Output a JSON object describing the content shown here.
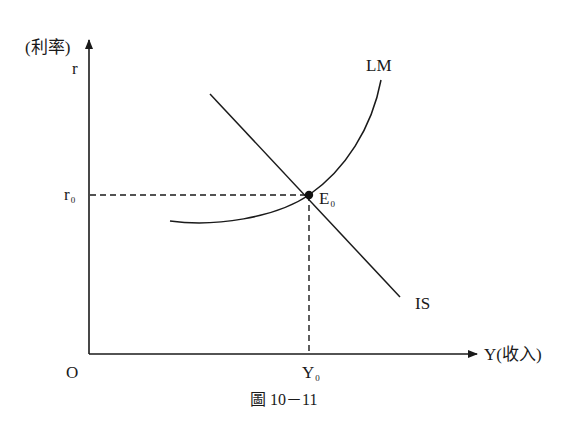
{
  "diagram": {
    "type": "IS-LM model",
    "y_axis": {
      "label": "(利率)",
      "symbol": "r"
    },
    "x_axis": {
      "label": "Y(收入)"
    },
    "origin_label": "O",
    "equilibrium": {
      "label": "E",
      "subscript": "0"
    },
    "r0": {
      "label": "r",
      "subscript": "0"
    },
    "y0": {
      "label": "Y",
      "subscript": "0"
    },
    "curves": [
      {
        "name": "LM",
        "label": "LM",
        "shape": "upward-sloping convex curve"
      },
      {
        "name": "IS",
        "label": "IS",
        "shape": "downward-sloping line"
      }
    ],
    "caption": "圖 10－11",
    "colors": {
      "line": "#1a1a1a",
      "background": "#ffffff"
    }
  }
}
